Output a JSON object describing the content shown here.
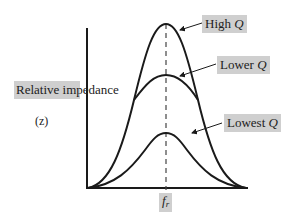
{
  "diagram": {
    "y_axis_label": "Relative impedance",
    "y_axis_symbol": "(z)",
    "x_axis_marker": {
      "main": "f",
      "sub": "r"
    },
    "curves": [
      {
        "name": "High Q",
        "text": "High",
        "q": "Q"
      },
      {
        "name": "Lower Q",
        "text": "Lower",
        "q": "Q"
      },
      {
        "name": "Lowest Q",
        "text": "Lowest",
        "q": "Q"
      }
    ],
    "colors": {
      "line": "#1a1a1a",
      "label_bg": "#cfcfcf"
    }
  }
}
